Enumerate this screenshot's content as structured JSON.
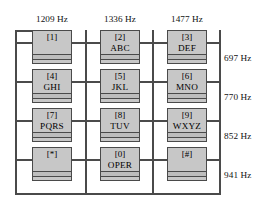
{
  "diagram": {
    "colors": {
      "key_fill": "#c7c7c7",
      "wire": "#4a4a4a",
      "background": "#ffffff",
      "text": "#000000"
    }
  },
  "column_frequencies": [
    {
      "label": "1209 Hz"
    },
    {
      "label": "1336 Hz"
    },
    {
      "label": "1477 Hz"
    }
  ],
  "row_frequencies": [
    {
      "label": "697 Hz"
    },
    {
      "label": "770 Hz"
    },
    {
      "label": "852 Hz"
    },
    {
      "label": "941 Hz"
    }
  ],
  "keys": [
    {
      "digit": "[1]",
      "letters": ""
    },
    {
      "digit": "[2]",
      "letters": "ABC"
    },
    {
      "digit": "[3]",
      "letters": "DEF"
    },
    {
      "digit": "[4]",
      "letters": "GHI"
    },
    {
      "digit": "[5]",
      "letters": "JKL"
    },
    {
      "digit": "[6]",
      "letters": "MNO"
    },
    {
      "digit": "[7]",
      "letters": "PQRS"
    },
    {
      "digit": "[8]",
      "letters": "TUV"
    },
    {
      "digit": "[9]",
      "letters": "WXYZ"
    },
    {
      "digit": "[*]",
      "letters": ""
    },
    {
      "digit": "[0]",
      "letters": "OPER"
    },
    {
      "digit": "[#]",
      "letters": ""
    }
  ]
}
